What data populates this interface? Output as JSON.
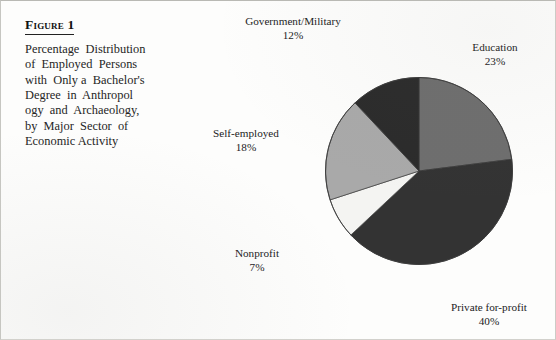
{
  "figure": {
    "title": "Figure 1",
    "caption_lines": [
      "Percentage  Distribution",
      "of  Employed  Persons",
      "with  Only a  Bachelor's",
      "Degree  in  Anthropol",
      "ogy  and  Archaeology,",
      "by  Major  Sector  of",
      "Economic Activity"
    ]
  },
  "chart_data": {
    "type": "pie",
    "categories": [
      "Education",
      "Private for-profit",
      "Nonprofit",
      "Self-employed",
      "Government/Military"
    ],
    "values": [
      23,
      40,
      7,
      18,
      12
    ],
    "value_suffix": "%",
    "start_angle_deg": 0,
    "direction": "clockwise",
    "legend": "none",
    "labels_position": "outside-callout",
    "slices": [
      {
        "label": "Education",
        "value": 23,
        "value_text": "23%",
        "color": "#6e6e6e"
      },
      {
        "label": "Private for-profit",
        "value": 40,
        "value_text": "40%",
        "color": "#333333"
      },
      {
        "label": "Nonprofit",
        "value": 7,
        "value_text": "7%",
        "color": "#f4f4f2"
      },
      {
        "label": "Self-employed",
        "value": 18,
        "value_text": "18%",
        "color": "#a9a9a9"
      },
      {
        "label": "Government/Military",
        "value": 12,
        "value_text": "12%",
        "color": "#2b2b2b"
      }
    ]
  },
  "labels": {
    "government": {
      "name": "Government/Military",
      "pct": "12%"
    },
    "education": {
      "name": "Education",
      "pct": "23%"
    },
    "self": {
      "name": "Self-employed",
      "pct": "18%"
    },
    "nonprofit": {
      "name": "Nonprofit",
      "pct": "7%"
    },
    "private": {
      "name": "Private for-profit",
      "pct": "40%"
    }
  }
}
